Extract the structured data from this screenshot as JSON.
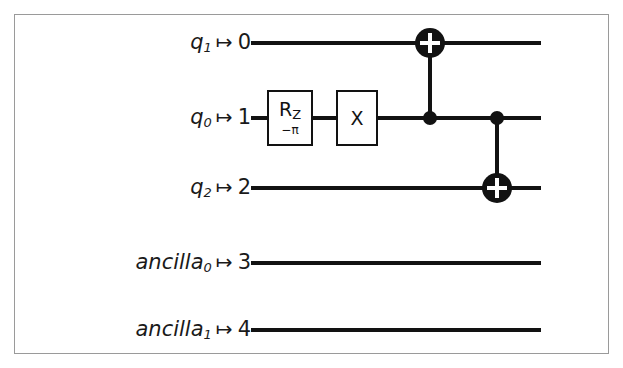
{
  "figure": {
    "kind": "quantum-circuit-diagram",
    "border_color": "#9a9a9a",
    "background": "#ffffff",
    "ink_color": "#121212"
  },
  "circuit": {
    "wire_start_x": 251,
    "wire_end_x": 541,
    "wires": [
      {
        "name": "q1",
        "label_base": "q",
        "label_sub": "1",
        "arrow": "↦",
        "index": "0",
        "y": 43
      },
      {
        "name": "q0",
        "label_base": "q",
        "label_sub": "0",
        "arrow": "↦",
        "index": "1",
        "y": 118
      },
      {
        "name": "q2",
        "label_base": "q",
        "label_sub": "2",
        "arrow": "↦",
        "index": "2",
        "y": 188
      },
      {
        "name": "ancilla0",
        "label_base": "ancilla",
        "label_sub": "0",
        "arrow": "↦",
        "index": "3",
        "y": 263
      },
      {
        "name": "ancilla1",
        "label_base": "ancilla",
        "label_sub": "1",
        "arrow": "↦",
        "index": "4",
        "y": 330
      }
    ],
    "gates": [
      {
        "type": "box",
        "name": "rz-gate",
        "main": "R",
        "main_sub": "Z",
        "param": "−π",
        "wire": "q0",
        "x": 290,
        "y": 118,
        "width": 46,
        "height": 56
      },
      {
        "type": "box",
        "name": "x-gate",
        "main": "X",
        "main_sub": "",
        "param": "",
        "wire": "q0",
        "x": 357,
        "y": 118,
        "width": 42,
        "height": 56
      },
      {
        "type": "cnot",
        "name": "cnot-1",
        "control_wire": "q0",
        "target_wire": "q1",
        "x": 430,
        "control_y": 118,
        "target_y": 43
      },
      {
        "type": "cnot",
        "name": "cnot-2",
        "control_wire": "q0",
        "target_wire": "q2",
        "x": 497,
        "control_y": 118,
        "target_y": 188
      }
    ],
    "style": {
      "wire_thickness": 4,
      "control_dot_radius": 7,
      "target_circle_radius": 15,
      "target_plus_arm": 10,
      "target_plus_thickness": 4
    }
  }
}
